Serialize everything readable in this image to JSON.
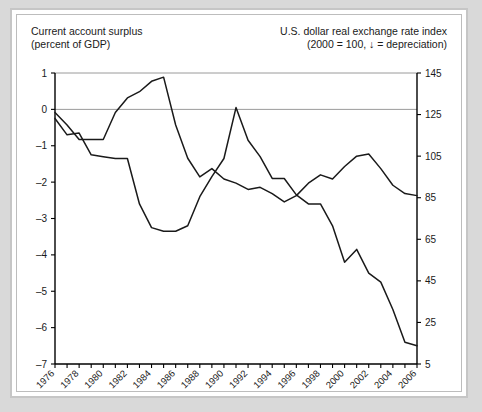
{
  "titles": {
    "left": "Current account surplus\n(percent of GDP)",
    "right": "U.S. dollar real exchange rate index\n(2000  = 100, ↓ = depreciation)"
  },
  "colors": {
    "page_background": "#d9d9d9",
    "panel_background": "#ffffff",
    "frame": "#c6c6c6",
    "line": "#1a1a1a",
    "gridline": "#9a9a9a"
  },
  "chart_data": {
    "type": "line",
    "title": "",
    "xlabel": "",
    "ylabel": "Current account surplus (percent of GDP)",
    "y2label": "U.S. dollar real exchange rate index (2000 = 100)",
    "xlim": [
      1976,
      2006
    ],
    "ylim": [
      -7,
      1
    ],
    "y2lim": [
      5,
      145
    ],
    "grid": false,
    "legend_position": "none",
    "yticks": [
      1,
      0,
      -1,
      -2,
      -3,
      -4,
      -5,
      -6,
      -7
    ],
    "y2ticks": [
      145,
      125,
      105,
      85,
      65,
      45,
      25,
      5
    ],
    "xticks": [
      1976,
      1978,
      1980,
      1982,
      1984,
      1986,
      1988,
      1990,
      1992,
      1994,
      1996,
      1998,
      2000,
      2002,
      2004,
      2006
    ],
    "xticks_minor_every": 1,
    "x": [
      1976,
      1977,
      1978,
      1979,
      1980,
      1981,
      1982,
      1983,
      1984,
      1985,
      1986,
      1987,
      1988,
      1989,
      1990,
      1991,
      1992,
      1993,
      1994,
      1995,
      1996,
      1997,
      1998,
      1999,
      2000,
      2001,
      2002,
      2003,
      2004,
      2005,
      2006
    ],
    "series": [
      {
        "name": "Current account surplus (percent of GDP)",
        "axis": "left",
        "units": "percent of GDP",
        "values": [
          -0.25,
          -0.7,
          -0.65,
          -1.25,
          -1.3,
          -1.35,
          -1.35,
          -2.6,
          -3.25,
          -3.35,
          -3.35,
          -3.2,
          -2.4,
          -1.85,
          -1.35,
          0.05,
          -0.85,
          -1.3,
          -1.9,
          -1.9,
          -1.95,
          -2.05,
          -2.25,
          -2.6,
          -2.5,
          -2.25,
          -2.1,
          -3.1,
          -3.55,
          -4.1,
          -4.3
        ],
        "note": "Continues to about -6.5 by 2006 after steep decline from 1998"
      },
      {
        "name": "U.S. dollar real exchange rate index (2000 = 100)",
        "axis": "right",
        "units": "index, 2000 = 100",
        "values": [
          125,
          119,
          115,
          115,
          113,
          124,
          128,
          134,
          140,
          141,
          122,
          108,
          98,
          101,
          97,
          94,
          92,
          93,
          89,
          86,
          89,
          95,
          97,
          97,
          100,
          104,
          103,
          96,
          91,
          87,
          86
        ],
        "note": "Peaks about 141 in 1985, trough about 86 in 1995 and again 2006"
      }
    ],
    "left_line_points": [
      [
        1976,
        -0.25
      ],
      [
        1977,
        -0.7
      ],
      [
        1978,
        -0.65
      ],
      [
        1979,
        -1.25
      ],
      [
        1980,
        -1.3
      ],
      [
        1981,
        -1.35
      ],
      [
        1982,
        -1.35
      ],
      [
        1983,
        -2.6
      ],
      [
        1984,
        -3.25
      ],
      [
        1985,
        -3.35
      ],
      [
        1986,
        -3.35
      ],
      [
        1987,
        -3.2
      ],
      [
        1988,
        -2.4
      ],
      [
        1989,
        -1.85
      ],
      [
        1990,
        -1.35
      ],
      [
        1991,
        0.05
      ],
      [
        1992,
        -0.85
      ],
      [
        1993,
        -1.3
      ],
      [
        1994,
        -1.9
      ],
      [
        1995,
        -1.9
      ],
      [
        1996,
        -2.35
      ],
      [
        1997,
        -2.6
      ],
      [
        1998,
        -2.6
      ],
      [
        1999,
        -3.2
      ],
      [
        2000,
        -4.2
      ],
      [
        2001,
        -3.85
      ],
      [
        2002,
        -4.5
      ],
      [
        2003,
        -4.75
      ],
      [
        2004,
        -5.5
      ],
      [
        2005,
        -6.4
      ],
      [
        2006,
        -6.5
      ]
    ],
    "right_line_points_index": [
      [
        1976,
        126
      ],
      [
        1977,
        120
      ],
      [
        1978,
        113
      ],
      [
        1979,
        113
      ],
      [
        1980,
        113
      ],
      [
        1981,
        126
      ],
      [
        1982,
        133
      ],
      [
        1983,
        136
      ],
      [
        1984,
        141
      ],
      [
        1985,
        143
      ],
      [
        1986,
        120
      ],
      [
        1987,
        104
      ],
      [
        1988,
        95
      ],
      [
        1989,
        99
      ],
      [
        1990,
        94
      ],
      [
        1991,
        92
      ],
      [
        1992,
        89
      ],
      [
        1993,
        90
      ],
      [
        1994,
        87
      ],
      [
        1995,
        83
      ],
      [
        1996,
        86
      ],
      [
        1997,
        92
      ],
      [
        1998,
        96
      ],
      [
        1999,
        94
      ],
      [
        2000,
        100
      ],
      [
        2001,
        105
      ],
      [
        2002,
        106
      ],
      [
        2003,
        99
      ],
      [
        2004,
        91
      ],
      [
        2005,
        87
      ],
      [
        2006,
        86
      ]
    ]
  }
}
